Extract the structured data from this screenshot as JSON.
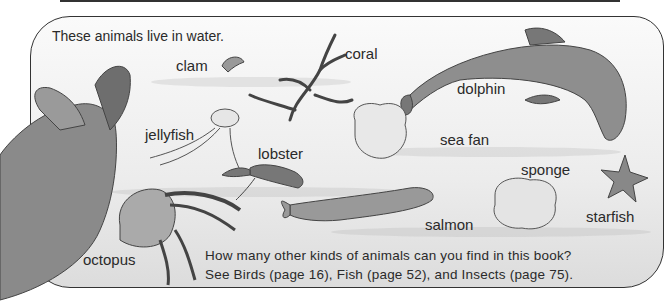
{
  "intro": "These animals live in water.",
  "labels": {
    "clam": "clam",
    "coral": "coral",
    "dolphin": "dolphin",
    "jellyfish": "jellyfish",
    "lobster": "lobster",
    "sea_fan": "sea fan",
    "sponge": "sponge",
    "starfish": "starfish",
    "salmon": "salmon",
    "octopus": "octopus"
  },
  "footer": {
    "line1": "How many other kinds of animals can you find in this book?",
    "line2": "See Birds (page 16), Fish (page 52), and Insects (page 75)."
  },
  "colors": {
    "ink": "#2a2a2a",
    "panel_bg": "#ececec",
    "border": "#333333"
  }
}
